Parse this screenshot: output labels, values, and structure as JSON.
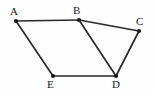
{
  "figure": {
    "name": "polygon-abcde-diagram",
    "background_color": "#fefefe",
    "line_color": "#2a2a2a",
    "vertex_color": "#1a1a1a",
    "width": 154,
    "height": 95
  },
  "vertices": [
    {
      "label": "A",
      "x": 16,
      "y": 21,
      "label_x": 10,
      "label_y": 6
    },
    {
      "label": "B",
      "x": 79,
      "y": 20,
      "label_x": 73,
      "label_y": 5
    },
    {
      "label": "C",
      "x": 139,
      "y": 31,
      "label_x": 136,
      "label_y": 16
    },
    {
      "label": "D",
      "x": 116,
      "y": 76,
      "label_x": 112,
      "label_y": 79
    },
    {
      "label": "E",
      "x": 53,
      "y": 76,
      "label_x": 47,
      "label_y": 79
    }
  ],
  "edges": [
    {
      "name": "edge-ab",
      "from": "A",
      "to": "B"
    },
    {
      "name": "edge-bc",
      "from": "B",
      "to": "C"
    },
    {
      "name": "edge-cd",
      "from": "C",
      "to": "D"
    },
    {
      "name": "edge-de",
      "from": "D",
      "to": "E"
    },
    {
      "name": "edge-ea",
      "from": "E",
      "to": "A"
    },
    {
      "name": "edge-bd",
      "from": "B",
      "to": "D"
    }
  ]
}
